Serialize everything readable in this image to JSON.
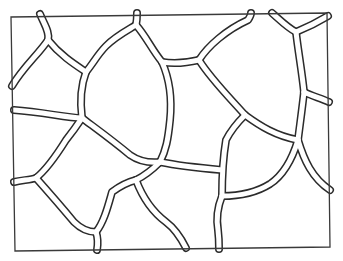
{
  "figure": {
    "stroke_color": "#2b2b2b",
    "background_color": "#ffffff",
    "frame": {
      "corners": [
        [
          11,
          17
        ],
        [
          327,
          13
        ],
        [
          330,
          247
        ],
        [
          15,
          251
        ]
      ]
    },
    "channels": [
      "M40 14 C44 24 50 32 48 40",
      "M48 40 C38 55 24 66 12 86",
      "M48 40 C60 55 74 64 86 72",
      "M86 72 C94 62 98 54 106 46 C116 36 128 30 136 25",
      "M136 25 C137 20 137 16 137 13",
      "M136 25 C146 36 152 50 162 62",
      "M162 62 C174 64 186 63 199 60",
      "M199 60 C208 46 226 30 248 20 C250 17 251 15 251 13",
      "M86 72 C80 88 80 102 82 118",
      "M162 62 C170 80 172 100 170 120 C168 140 166 150 160 162",
      "M82 118 C66 118 44 112 14 110",
      "M82 118 C98 130 112 140 130 155 C140 162 150 163 160 162",
      "M199 60 C210 78 228 96 245 115",
      "M272 13 C280 20 288 28 296 32",
      "M296 32 C306 28 318 22 328 16",
      "M296 32 C298 50 302 72 304 92",
      "M304 92 C312 96 320 98 329 102",
      "M304 92 C302 110 300 124 298 140",
      "M245 115 C260 126 276 136 298 140",
      "M298 140 C304 160 312 178 330 190",
      "M298 140 C292 160 282 176 270 184 C254 194 236 196 222 196",
      "M245 115 C236 124 230 132 226 140 C224 152 222 170 222 196",
      "M160 162 C180 166 200 168 222 170",
      "M14 182 C22 180 30 180 36 178",
      "M36 178 C46 170 56 156 66 140 C74 130 78 124 82 118",
      "M36 178 C52 196 64 210 74 222 C80 228 88 232 96 232",
      "M96 232 C98 238 98 244 97 250",
      "M96 232 C104 222 108 206 112 192 C120 186 128 182 136 180",
      "M136 180 C144 176 152 170 160 162",
      "M136 180 C142 196 150 210 166 222 C174 228 180 236 186 248",
      "M222 196 C218 206 216 218 218 230 C219 238 219 244 219 249"
    ]
  }
}
